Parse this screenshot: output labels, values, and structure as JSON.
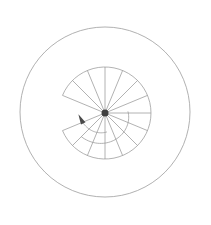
{
  "figure": {
    "canvas": {
      "width": 211,
      "height": 225,
      "background": "#ffffff"
    },
    "colors": {
      "line": "#989898",
      "outer_circle": "#9d9d9d",
      "hub_dot": "#3f3f3f",
      "arrow": "#4a4a4a"
    },
    "outer_circle": {
      "cx": 105,
      "cy": 112,
      "r": 85,
      "stroke_width": 0.8
    },
    "hub_dot": {
      "cx": 105,
      "cy": 113,
      "r": 3.5
    },
    "spokes": {
      "cx": 105,
      "cy": 113,
      "length": 46,
      "stroke_width": 0.75,
      "math_angles_deg": [
        0,
        22.5,
        45,
        67.5,
        90,
        112.5,
        135,
        157.5,
        202.5,
        225,
        247.5,
        270,
        292.5,
        315,
        337.5
      ]
    },
    "outer_arc": {
      "cx": 105,
      "cy": 113,
      "r": 46,
      "start_math_deg": 157.5,
      "end_math_deg": 202.5,
      "large_arc": 1,
      "sweep": 1,
      "stroke_width": 0.75
    },
    "spiral_arcs": [
      {
        "name": "spiral-turn-inner",
        "screen_start_deg": 84,
        "screen_end_deg": 161,
        "r_start": 19,
        "r_end": 24.4
      },
      {
        "name": "spiral-turn-outer",
        "screen_start_deg": -4,
        "screen_end_deg": 135,
        "r_start": 23,
        "r_end": 33.5
      }
    ],
    "direction_arrow": {
      "on_arc": "spiral-turn-inner",
      "size": 3.4
    }
  }
}
